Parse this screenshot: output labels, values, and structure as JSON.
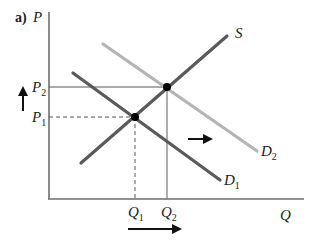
{
  "panel_label": "a)",
  "axes": {
    "y_label": "P",
    "x_label": "Q"
  },
  "price_levels": {
    "p1": {
      "label": "P",
      "sub": "1"
    },
    "p2": {
      "label": "P",
      "sub": "2"
    }
  },
  "quantity_levels": {
    "q1": {
      "label": "Q",
      "sub": "1"
    },
    "q2": {
      "label": "Q",
      "sub": "2"
    }
  },
  "curves": {
    "supply": {
      "label": "S",
      "color": "#5a5a5a"
    },
    "demand1": {
      "label": "D",
      "sub": "1",
      "color": "#5a5a5a"
    },
    "demand2": {
      "label": "D",
      "sub": "2",
      "color": "#b4b4b4"
    }
  },
  "colors": {
    "axis": "#6e6e6e",
    "guide": "#555555",
    "point": "#000000",
    "arrow": "#111111"
  },
  "annotations": {
    "price_arrow": "up",
    "demand_shift_arrow": "right",
    "quantity_arrow": "right"
  }
}
